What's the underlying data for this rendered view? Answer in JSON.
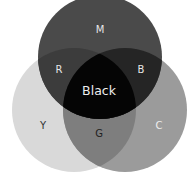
{
  "diagram": {
    "type": "venn-3",
    "circles": [
      {
        "id": "M",
        "cx": 100,
        "cy": 57,
        "r": 62,
        "color": "#4a4a4a"
      },
      {
        "id": "Y",
        "cx": 74,
        "cy": 110,
        "r": 62,
        "color": "#d9d9d9"
      },
      {
        "id": "C",
        "cx": 125,
        "cy": 110,
        "r": 62,
        "color": "#9b9b9b"
      }
    ],
    "regions": {
      "M": {
        "label": "M",
        "color": "#4a4a4a",
        "label_color": "#e6e6e6"
      },
      "Y": {
        "label": "Y",
        "color": "#d9d9d9",
        "label_color": "#333333"
      },
      "C": {
        "label": "C",
        "color": "#9b9b9b",
        "label_color": "#eeeeee"
      },
      "R": {
        "label": "R",
        "color": "#3c3c3c",
        "label_color": "#e6e6e6"
      },
      "B": {
        "label": "B",
        "color": "#252525",
        "label_color": "#e6e6e6"
      },
      "G": {
        "label": "G",
        "color": "#7e7e7e",
        "label_color": "#222222"
      },
      "Black": {
        "label": "Black",
        "color": "#050505",
        "label_color": "#eeeeee"
      }
    }
  }
}
